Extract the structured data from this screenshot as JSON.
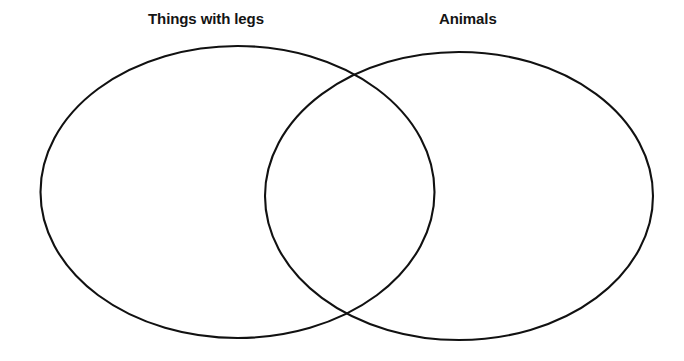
{
  "diagram": {
    "type": "venn",
    "sets_count": 2,
    "background_color": "#ffffff",
    "stroke_color": "#111111",
    "stroke_width": 2.1,
    "fill": "none",
    "labels": {
      "left": "Things with legs",
      "right": "Animals"
    },
    "sets": [
      {
        "id": "left-set",
        "label": "Things with legs",
        "shape": "ellipse",
        "cx": 237.5,
        "cy": 192,
        "rx": 197,
        "ry": 146,
        "contents": []
      },
      {
        "id": "right-set",
        "label": "Animals",
        "shape": "ellipse",
        "cx": 459,
        "cy": 196,
        "rx": 194,
        "ry": 144,
        "contents": []
      }
    ],
    "regions": [
      {
        "id": "left-only",
        "name": "Things with legs only",
        "contents": []
      },
      {
        "id": "intersection",
        "name": "Things with legs and Animals",
        "contents": []
      },
      {
        "id": "right-only",
        "name": "Animals only",
        "contents": []
      }
    ],
    "intersection_points": [
      {
        "x": 350,
        "y": 76
      },
      {
        "x": 348,
        "y": 312
      }
    ]
  }
}
